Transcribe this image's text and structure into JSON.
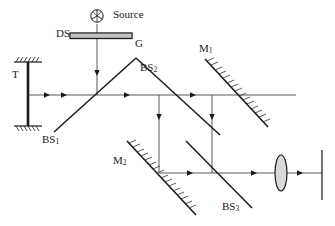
{
  "figure": {
    "background_color": "#ffffff",
    "line_color": "#595959",
    "dark_color": "#1a1a1a",
    "width": 335,
    "height": 226
  },
  "labels": {
    "source": "Source",
    "ds": "DS",
    "g": "G",
    "t": "T",
    "bs1_prefix": "BS",
    "bs1_sub": "1",
    "bs2_prefix": "BS",
    "bs2_sub": "2",
    "bs3_prefix": "BS",
    "bs3_sub": "3",
    "m1_prefix": "M",
    "m1_sub": "1",
    "m2_prefix": "M",
    "m2_sub": "2"
  },
  "components": {
    "source_icon": "light-source-icon",
    "grating_icon": "diffraction-grating-icon",
    "mirror_t_icon": "mirror-with-mount-icon",
    "lens_icon": "convex-lens-icon",
    "screen_icon": "detector-screen-icon",
    "beamsplitter_icon": "beam-splitter-icon",
    "arrow_icon": "beam-direction-arrow-icon"
  },
  "geometry": {
    "upper_beam_y": 95,
    "lower_beam_y": 173,
    "left_vertical_x": 159,
    "right_vertical_x": 212,
    "source_x": 97,
    "grating_y": 37
  }
}
